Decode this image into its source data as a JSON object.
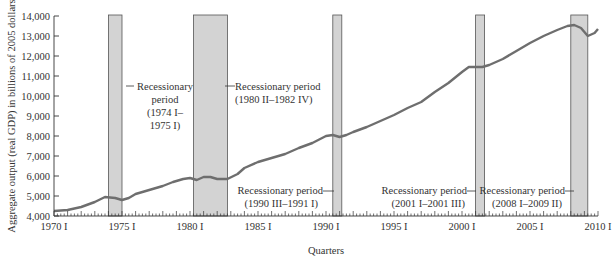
{
  "chart_data": {
    "type": "line",
    "title": "",
    "xlabel": "Quarters",
    "ylabel": "Aggregate output (real GDP) in billions of 2005 dollars",
    "ylim": [
      4000,
      14000
    ],
    "xlim": [
      1970,
      2010
    ],
    "grid": false,
    "y_ticks": [
      4000,
      5000,
      6000,
      7000,
      8000,
      9000,
      10000,
      11000,
      12000,
      13000,
      14000
    ],
    "y_tick_labels": [
      "4,000",
      "5,000",
      "6,000",
      "7,000",
      "8,000",
      "9,000",
      "10,000",
      "11,000",
      "12,000",
      "13,000",
      "14,000"
    ],
    "x_ticks": [
      1970,
      1975,
      1980,
      1985,
      1990,
      1995,
      2000,
      2005,
      2010
    ],
    "x_tick_labels": [
      "1970 I",
      "1975 I",
      "1980 I",
      "1985 I",
      "1990 I",
      "1995 I",
      "2000 I",
      "2005 I",
      "2010 I"
    ],
    "series": [
      {
        "name": "Real GDP",
        "color": "#6e6e6e",
        "x": [
          1970.0,
          1971.0,
          1972.0,
          1973.0,
          1973.75,
          1974.5,
          1975.0,
          1975.5,
          1976.0,
          1977.0,
          1978.0,
          1978.75,
          1979.5,
          1980.0,
          1980.5,
          1981.0,
          1981.5,
          1982.0,
          1982.75,
          1983.5,
          1984.0,
          1985.0,
          1986.0,
          1987.0,
          1988.0,
          1989.0,
          1990.0,
          1990.5,
          1991.0,
          1991.5,
          1992.0,
          1993.0,
          1994.0,
          1995.0,
          1996.0,
          1997.0,
          1998.0,
          1999.0,
          2000.0,
          2000.5,
          2001.0,
          2001.5,
          2002.0,
          2003.0,
          2004.0,
          2005.0,
          2006.0,
          2007.0,
          2007.75,
          2008.25,
          2008.75,
          2009.25,
          2009.75,
          2010.0
        ],
        "values": [
          4250,
          4300,
          4450,
          4700,
          4950,
          4900,
          4800,
          4900,
          5100,
          5300,
          5500,
          5700,
          5850,
          5900,
          5800,
          5950,
          5950,
          5850,
          5850,
          6100,
          6400,
          6700,
          6900,
          7100,
          7400,
          7650,
          8000,
          8050,
          7950,
          8050,
          8200,
          8450,
          8750,
          9050,
          9400,
          9700,
          10200,
          10650,
          11200,
          11450,
          11450,
          11450,
          11550,
          11850,
          12250,
          12650,
          13000,
          13300,
          13500,
          13550,
          13400,
          13000,
          13150,
          13350
        ]
      }
    ],
    "shaded_regions": [
      {
        "start": 1974.0,
        "end": 1975.0,
        "label": "Recessionary period (1974 I–1975 I)"
      },
      {
        "start": 1980.25,
        "end": 1982.75,
        "label": "Recessionary period (1980 II–1982 IV)"
      },
      {
        "start": 1990.5,
        "end": 1991.0,
        "label": "Recessionary period (1990 III–1991 I)"
      },
      {
        "start": 2001.0,
        "end": 2001.5,
        "label": "Recessionary period (2001 I–2001 III)"
      },
      {
        "start": 2008.0,
        "end": 2009.25,
        "label": "Recessionary period (2008 I–2009 II)"
      }
    ],
    "annotations": [
      {
        "lines": [
          "Recessionary",
          "period",
          "(1974 I–",
          "1975 I)"
        ]
      },
      {
        "lines": [
          "Recessionary period",
          "(1980 II–1982 IV)"
        ]
      },
      {
        "lines": [
          "Recessionary period",
          "(1990 III–1991 I)"
        ]
      },
      {
        "lines": [
          "Recessionary period",
          "(2001 I–2001 III)"
        ]
      },
      {
        "lines": [
          "Recessionary period",
          "(2008 I–2009 II)"
        ]
      }
    ],
    "colors": {
      "line": "#6e6e6e",
      "shade": "#d3d3d3",
      "shade_border": "#555555",
      "axis": "#333333"
    }
  }
}
